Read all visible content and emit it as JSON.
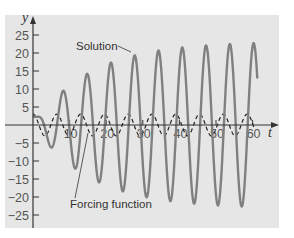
{
  "chart_data": {
    "type": "line",
    "title": "",
    "xlabel": "t",
    "ylabel": "y",
    "xlim": [
      0,
      62
    ],
    "ylim": [
      -28,
      28
    ],
    "grid": false,
    "legend": "none (inline annotations)",
    "x_ticks": [
      10,
      20,
      30,
      40,
      50,
      60
    ],
    "x_tick_labels": [
      "10",
      "20",
      "30",
      "40",
      "50",
      "60"
    ],
    "y_ticks": [
      25,
      20,
      15,
      10,
      5,
      -5,
      -10,
      -15,
      -20,
      -25
    ],
    "y_tick_labels": [
      "25",
      "20",
      "15",
      "10",
      "5",
      "−5",
      "−10",
      "−15",
      "−20",
      "−25"
    ],
    "series": [
      {
        "name": "Solution",
        "style": "solid gray",
        "description": "oscillation with growing amplitude approaching ~23",
        "peaks": [
          {
            "t": 7.9,
            "y": 9
          },
          {
            "t": 14.5,
            "y": 14
          },
          {
            "t": 20.8,
            "y": 17
          },
          {
            "t": 27.3,
            "y": 19.5
          },
          {
            "t": 33.9,
            "y": 20.8
          },
          {
            "t": 40.4,
            "y": 22
          },
          {
            "t": 46.7,
            "y": 22.5
          },
          {
            "t": 53.3,
            "y": 23
          },
          {
            "t": 59.8,
            "y": 23
          }
        ],
        "troughs": [
          {
            "t": 4.8,
            "y": -6
          },
          {
            "t": 11.2,
            "y": -12
          },
          {
            "t": 17.6,
            "y": -16
          },
          {
            "t": 24.1,
            "y": -18.5
          },
          {
            "t": 30.6,
            "y": -20.5
          },
          {
            "t": 37.1,
            "y": -21.5
          },
          {
            "t": 43.6,
            "y": -22.5
          },
          {
            "t": 50.0,
            "y": -23
          },
          {
            "t": 56.5,
            "y": -23
          }
        ]
      },
      {
        "name": "Forcing function",
        "style": "dashed black",
        "description": "periodic forcing, amplitude ~3, period ~6.5",
        "amplitude": 3,
        "period": 6.5
      }
    ],
    "annotations": [
      {
        "text": "Solution",
        "arrow_to": {
          "t": 27.3,
          "y": 19.5
        }
      },
      {
        "text": "Forcing function",
        "arrow_to": {
          "t": 17,
          "y": -3
        }
      }
    ]
  },
  "labels": {
    "y_axis": "y",
    "x_axis": "t",
    "solution": "Solution",
    "forcing": "Forcing function"
  },
  "colors": {
    "panel_bg": "#e6e6e6",
    "solution": "#808080",
    "forcing": "#222222",
    "axis": "#333333"
  }
}
